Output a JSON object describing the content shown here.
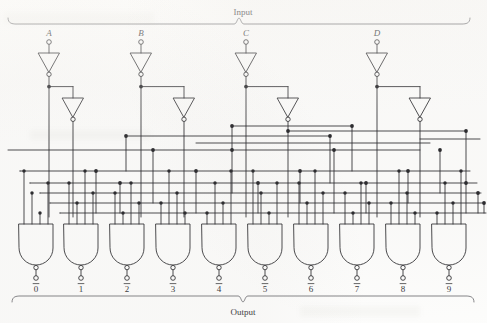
{
  "figure": {
    "title_top": "Input",
    "title_bottom": "Output",
    "kind": "bcd-to-decimal-decoder-logic-diagram",
    "ink_color": "#27272b",
    "label_color": "#3a3a3c",
    "background_color": "#fdfdfc"
  },
  "inputs": [
    {
      "label": "A",
      "x": 49,
      "second_inverter_x": 73
    },
    {
      "label": "B",
      "x": 141,
      "second_inverter_x": 184
    },
    {
      "label": "C",
      "x": 246,
      "second_inverter_x": 288
    },
    {
      "label": "D",
      "x": 377,
      "second_inverter_x": 420
    }
  ],
  "buses": {
    "count": 5,
    "y_values": [
      150,
      171,
      183,
      193,
      203,
      213
    ]
  },
  "gates": {
    "type": "NAND",
    "inputs_per_gate": 4,
    "count": 10,
    "centers_x": [
      36,
      81,
      127,
      173,
      219,
      265,
      311,
      357,
      403,
      449
    ],
    "body_top": 224,
    "body_bottom": 265,
    "labels": [
      "0",
      "1",
      "2",
      "3",
      "4",
      "5",
      "6",
      "7",
      "8",
      "9"
    ],
    "labels_overbarred": true,
    "label_y": 292
  },
  "outputs": [
    {
      "label": "0",
      "overbar": true
    },
    {
      "label": "1",
      "overbar": true
    },
    {
      "label": "2",
      "overbar": true
    },
    {
      "label": "3",
      "overbar": true
    },
    {
      "label": "4",
      "overbar": true
    },
    {
      "label": "5",
      "overbar": true
    },
    {
      "label": "6",
      "overbar": true
    },
    {
      "label": "7",
      "overbar": true
    },
    {
      "label": "8",
      "overbar": true
    },
    {
      "label": "9",
      "overbar": true
    }
  ],
  "braces": {
    "top": {
      "label": "Input",
      "x_start": 8,
      "x_end": 470,
      "y": 24,
      "label_x": 243,
      "label_y": 15
    },
    "bottom": {
      "label": "Output",
      "x_start": 12,
      "x_end": 474,
      "y": 296,
      "label_x": 243,
      "label_y": 315
    }
  }
}
